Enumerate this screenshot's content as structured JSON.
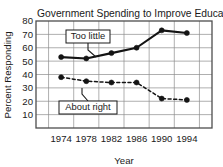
{
  "chart_data": {
    "type": "line",
    "title": "Government Spending to Improve Education",
    "xlabel": "Year",
    "ylabel": "Percent Responding",
    "categories": [
      "1974",
      "1978",
      "1982",
      "1986",
      "1990",
      "1994"
    ],
    "x": [
      1974,
      1978,
      1982,
      1986,
      1990,
      1994
    ],
    "ylim": [
      0,
      80
    ],
    "yticks": [
      10,
      20,
      30,
      40,
      50,
      60,
      70,
      80
    ],
    "ytick_labels": [
      "10",
      "20",
      "30",
      "40",
      "50",
      "60",
      "70",
      "80"
    ],
    "xtick_labels": [
      "1974",
      "1978",
      "1982",
      "1986",
      "1990",
      "1994"
    ],
    "grid": true,
    "legend_position": "inline-annotations",
    "series": [
      {
        "name": "Too little",
        "values": [
          53,
          52,
          56,
          60,
          73,
          71
        ],
        "line_style": "solid",
        "color": "#141414",
        "marker": "circle",
        "label_box": {
          "text": "Too little"
        }
      },
      {
        "name": "About right",
        "values": [
          38,
          35,
          34,
          34,
          22,
          21
        ],
        "line_style": "dashed",
        "color": "#141414",
        "marker": "circle",
        "label_box": {
          "text": "About right"
        }
      }
    ],
    "annotations": [
      {
        "text": "Too little",
        "points_to_series": "Too little"
      },
      {
        "text": "About right",
        "points_to_series": "About right"
      }
    ],
    "colors": {
      "line": "#141414",
      "grid": "#8c8c8c",
      "frame": "#4d4d4d",
      "text": "#1a1a1a",
      "background": "#ffffff",
      "label_box_fill": "#ffffff"
    }
  },
  "artifact": {
    "text": ""
  }
}
